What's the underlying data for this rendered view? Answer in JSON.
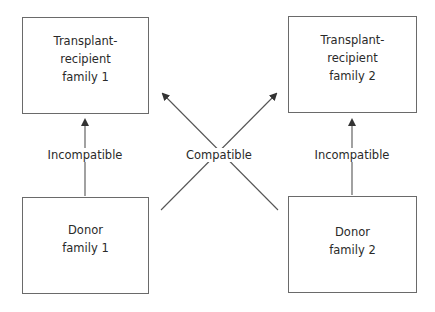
{
  "nodes": {
    "recipient1": {
      "label": "Transplant-\nrecipient\nfamily 1"
    },
    "recipient2": {
      "label": "Transplant-\nrecipient\nfamily 2"
    },
    "donor1": {
      "label": "Donor\nfamily 1"
    },
    "donor2": {
      "label": "Donor\nfamily 2"
    }
  },
  "edges": {
    "left": {
      "label": "Incompatible",
      "from": "donor1",
      "to": "recipient1"
    },
    "right": {
      "label": "Incompatible",
      "from": "donor2",
      "to": "recipient2"
    },
    "cross": {
      "label": "Compatible",
      "pairs": [
        [
          "donor1",
          "recipient2"
        ],
        [
          "donor2",
          "recipient1"
        ]
      ]
    }
  },
  "colors": {
    "line": "#555555",
    "border": "#6a6a6a",
    "text": "#2a2a2a"
  }
}
